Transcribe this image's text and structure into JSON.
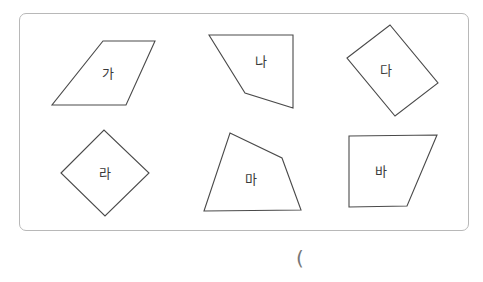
{
  "panel": {
    "border_color": "#b8b8b8"
  },
  "shapes": [
    {
      "label": "가",
      "points": "103,41 155,41 126,105 52,105",
      "label_pos": [
        108,
        74
      ]
    },
    {
      "label": "나",
      "points": "209,35 293,35 293,108 245,93",
      "label_pos": [
        261,
        62
      ]
    },
    {
      "label": "다",
      "points": "347,58 390,25 438,83 395,116",
      "label_pos": [
        386,
        71
      ]
    },
    {
      "label": "라",
      "points": "61,173 104,130 149,173 105,216",
      "label_pos": [
        105,
        174
      ]
    },
    {
      "label": "마",
      "points": "230,133 282,158 301,210 204,211",
      "label_pos": [
        251,
        180
      ]
    },
    {
      "label": "바",
      "points": "349,136 437,135 407,206 349,207",
      "label_pos": [
        381,
        172
      ]
    }
  ],
  "answer": {
    "open_paren": "("
  }
}
